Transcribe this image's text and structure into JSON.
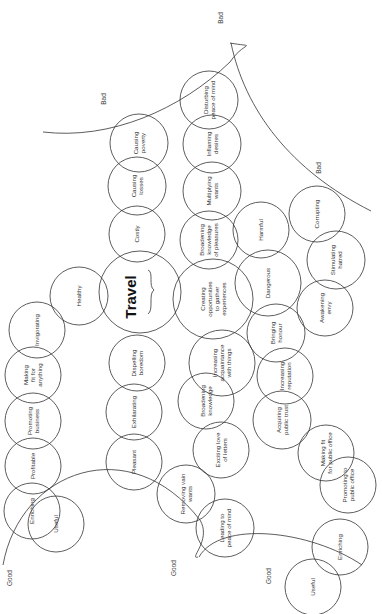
{
  "diagram": {
    "orientation": "rotated-90-ccw",
    "center": {
      "label": "Travel",
      "cx": 140,
      "cy": 292,
      "r": 41
    },
    "nodes": [
      {
        "id": "causing-poverty",
        "lines": [
          "Causing",
          "poverty"
        ],
        "cx": 139,
        "cy": 143,
        "r": 29
      },
      {
        "id": "causing-losses",
        "lines": [
          "Causing",
          "losses"
        ],
        "cx": 137,
        "cy": 186,
        "r": 29
      },
      {
        "id": "costly",
        "lines": [
          "Costly"
        ],
        "cx": 137,
        "cy": 234,
        "r": 28
      },
      {
        "id": "healthy",
        "lines": [
          "Healthy"
        ],
        "cx": 79,
        "cy": 296,
        "r": 29
      },
      {
        "id": "invigorating",
        "lines": [
          "Invigorating"
        ],
        "cx": 37,
        "cy": 330,
        "r": 28
      },
      {
        "id": "making-fit-for-anything",
        "lines": [
          "Making",
          "fit for",
          "anything"
        ],
        "cx": 33,
        "cy": 375,
        "r": 28
      },
      {
        "id": "promoting-business",
        "lines": [
          "Promoting",
          "business"
        ],
        "cx": 33,
        "cy": 421,
        "r": 28
      },
      {
        "id": "profitable",
        "lines": [
          "Profitable"
        ],
        "cx": 33,
        "cy": 466,
        "r": 28
      },
      {
        "id": "enriching-left",
        "lines": [
          "Enriching"
        ],
        "cx": 32,
        "cy": 511,
        "r": 28
      },
      {
        "id": "useful-left",
        "lines": [
          "Useful"
        ],
        "cx": 56,
        "cy": 524,
        "r": 28
      },
      {
        "id": "dispelling-boredom",
        "lines": [
          "Dispelling",
          "boredom"
        ],
        "cx": 137,
        "cy": 363,
        "r": 28
      },
      {
        "id": "exhilarating",
        "lines": [
          "Exhilarating"
        ],
        "cx": 134,
        "cy": 412,
        "r": 28
      },
      {
        "id": "pleasant",
        "lines": [
          "Pleasant"
        ],
        "cx": 134,
        "cy": 462,
        "r": 28
      },
      {
        "id": "disturbing-peace-of-mind",
        "lines": [
          "Disturbing",
          "peace of mind"
        ],
        "cx": 209,
        "cy": 100,
        "r": 29
      },
      {
        "id": "inflaming-desires",
        "lines": [
          "Inflaming",
          "desires"
        ],
        "cx": 212,
        "cy": 144,
        "r": 29
      },
      {
        "id": "multiplying-wants",
        "lines": [
          "Multiplying",
          "wants"
        ],
        "cx": 212,
        "cy": 191,
        "r": 29
      },
      {
        "id": "broadening-knowledge-of-pleasures",
        "lines": [
          "Broadening",
          "knowledge",
          "of pleasures"
        ],
        "cx": 209,
        "cy": 240,
        "r": 29
      },
      {
        "id": "creating-opportunities",
        "lines": [
          "Creating",
          "opportunities",
          "to gather",
          "experiences"
        ],
        "cx": 213,
        "cy": 299,
        "r": 40
      },
      {
        "id": "increasing-acquaintance",
        "lines": [
          "Increasing",
          "acquaintance",
          "with things"
        ],
        "cx": 222,
        "cy": 363,
        "r": 33
      },
      {
        "id": "broadening-knowledge",
        "lines": [
          "Broadening",
          "knowledge"
        ],
        "cx": 206,
        "cy": 401,
        "r": 28
      },
      {
        "id": "exciting-love-of-letters",
        "lines": [
          "Exciting love",
          "of letters"
        ],
        "cx": 221,
        "cy": 450,
        "r": 28
      },
      {
        "id": "removing-vain-wants",
        "lines": [
          "Removing vain",
          "wants"
        ],
        "cx": 186,
        "cy": 494,
        "r": 29
      },
      {
        "id": "leading-to-peace-of-mind",
        "lines": [
          "Leading to",
          "peace of mind"
        ],
        "cx": 225,
        "cy": 528,
        "r": 29
      },
      {
        "id": "harmful",
        "lines": [
          "Harmful"
        ],
        "cx": 261,
        "cy": 230,
        "r": 28
      },
      {
        "id": "dangerous",
        "lines": [
          "Dangerous"
        ],
        "cx": 268,
        "cy": 283,
        "r": 33
      },
      {
        "id": "corrupting",
        "lines": [
          "Corrupting"
        ],
        "cx": 317,
        "cy": 214,
        "r": 28
      },
      {
        "id": "stimulating-hatred",
        "lines": [
          "Stimulating",
          "hatred"
        ],
        "cx": 336,
        "cy": 260,
        "r": 29
      },
      {
        "id": "awakening-envy",
        "lines": [
          "Awakening",
          "envy"
        ],
        "cx": 325,
        "cy": 308,
        "r": 28
      },
      {
        "id": "bringing-honour",
        "lines": [
          "Bringing",
          "honour"
        ],
        "cx": 276,
        "cy": 333,
        "r": 29
      },
      {
        "id": "increasing-reputation",
        "lines": [
          "Increasing",
          "reputation"
        ],
        "cx": 285,
        "cy": 376,
        "r": 28
      },
      {
        "id": "acquiring-public-trust",
        "lines": [
          "Acquiring",
          "public trust"
        ],
        "cx": 282,
        "cy": 420,
        "r": 29
      },
      {
        "id": "making-fit-for-public-office",
        "lines": [
          "Making fit",
          "for public office"
        ],
        "cx": 326,
        "cy": 453,
        "r": 28
      },
      {
        "id": "promoting-to-public-office",
        "lines": [
          "Promoting to",
          "public office"
        ],
        "cx": 348,
        "cy": 485,
        "r": 28
      },
      {
        "id": "enriching-right",
        "lines": [
          "Enriching"
        ],
        "cx": 340,
        "cy": 547,
        "r": 28
      },
      {
        "id": "useful-right",
        "lines": [
          "Useful"
        ],
        "cx": 313,
        "cy": 587,
        "r": 28
      }
    ],
    "region_labels": [
      {
        "id": "bad-top-left",
        "text": "Bad",
        "x": 106,
        "y": 99
      },
      {
        "id": "bad-top-right",
        "text": "Bad",
        "x": 223,
        "y": 18
      },
      {
        "id": "bad-right",
        "text": "Bad",
        "x": 321,
        "y": 168
      },
      {
        "id": "good-left",
        "text": "Good",
        "x": 12,
        "y": 578
      },
      {
        "id": "good-middle",
        "text": "Good",
        "x": 176,
        "y": 568
      },
      {
        "id": "good-right",
        "text": "Good",
        "x": 271,
        "y": 576
      }
    ]
  }
}
